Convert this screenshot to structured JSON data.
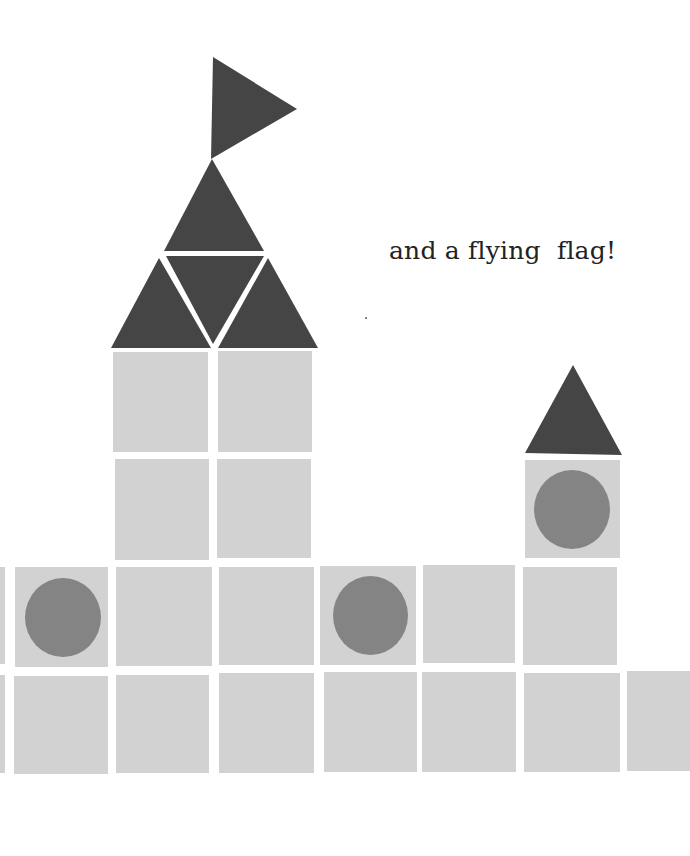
{
  "page": {
    "caption": "and a flying  flag!"
  },
  "colors": {
    "background": "#ffffff",
    "dark_shape": "#454545",
    "block": "#d2d2d2",
    "circle": "#848484"
  },
  "illustration": {
    "flag": {
      "shape": "triangle"
    },
    "main_tower": {
      "roof": {
        "triangles": 4
      },
      "blocks": 4
    },
    "small_tower": {
      "roof": {
        "triangles": 1
      },
      "window_block": {
        "has_circle": true
      }
    },
    "wall": {
      "row1_blocks": 7,
      "row2_blocks": 8,
      "circles": 2
    }
  }
}
